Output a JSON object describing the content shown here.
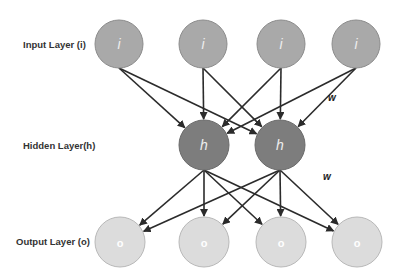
{
  "diagram": {
    "layers": [
      {
        "id": "input",
        "label": "Input Layer (i)",
        "node_symbol": "i",
        "count": 4,
        "fill": "#a9a9a9",
        "stroke": "#8c8c8c"
      },
      {
        "id": "hidden",
        "label": "Hidden Layer(h)",
        "node_symbol": "h",
        "count": 2,
        "fill": "#7d7d7d",
        "stroke": "#6a6a6a"
      },
      {
        "id": "output",
        "label": "Output Layer (o)",
        "node_symbol": "o",
        "count": 4,
        "fill": "#dcdcdc",
        "stroke": "#b8b8b8"
      }
    ],
    "weight_labels": [
      "w",
      "w"
    ],
    "connections": "fully-connected",
    "edge_color": "#2b2b2b"
  }
}
